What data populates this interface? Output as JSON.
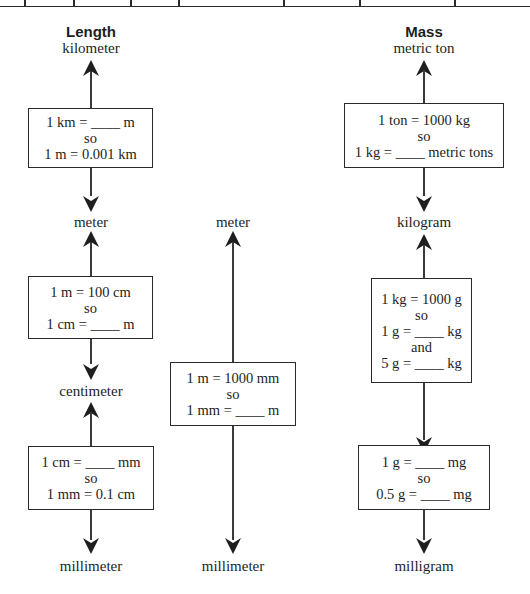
{
  "table_top": {
    "column_dividers_x": [
      24,
      73,
      130,
      178,
      283,
      359,
      454
    ]
  },
  "length": {
    "header": "Length",
    "units": {
      "top": "kilometer",
      "middle": "meter",
      "lower": "centimeter",
      "bottom": "millimeter"
    },
    "boxes": [
      {
        "lines": [
          "1 km = ____ m",
          "so",
          "1 m = 0.001 km"
        ]
      },
      {
        "lines": [
          "1 m = 100 cm",
          "so",
          "1 cm = ____ m"
        ]
      },
      {
        "lines": [
          "1 cm = ____ mm",
          "so",
          "1 mm = 0.1 cm"
        ]
      }
    ]
  },
  "middle": {
    "units": {
      "top": "meter",
      "bottom": "millimeter"
    },
    "box": {
      "lines": [
        "1 m = 1000 mm",
        "so",
        "1 mm = ____ m"
      ]
    }
  },
  "mass": {
    "header": "Mass",
    "units": {
      "top": "metric ton",
      "middle": "kilogram",
      "bottom": "milligram"
    },
    "boxes": [
      {
        "lines": [
          "1 ton = 1000 kg",
          "so",
          "1 kg = ____ metric tons"
        ]
      },
      {
        "lines": [
          "1 kg = 1000 g",
          "so",
          "1 g = ____ kg",
          "and",
          "5 g = ____ kg"
        ]
      },
      {
        "lines": [
          "1 g = ____ mg",
          "so",
          "0.5 g = ____ mg"
        ]
      }
    ]
  }
}
